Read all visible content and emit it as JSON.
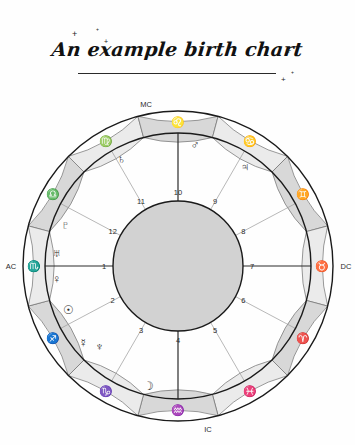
{
  "page": {
    "background_color": "#fefefe",
    "title": "An example birth chart"
  },
  "decorations": {
    "sparkles": [
      {
        "name": "sparkle-top-left",
        "x": 72,
        "y": 30,
        "size": 9
      },
      {
        "name": "sparkle-top-mid",
        "x": 96,
        "y": 27,
        "size": 5
      },
      {
        "name": "sparkle-top-mid2",
        "x": 104,
        "y": 38,
        "size": 7
      },
      {
        "name": "sparkle-right-top",
        "x": 286,
        "y": 47,
        "size": 9
      },
      {
        "name": "sparkle-right-low",
        "x": 281,
        "y": 76,
        "size": 8
      },
      {
        "name": "sparkle-right-dot",
        "x": 291,
        "y": 70,
        "size": 5
      }
    ]
  },
  "chart_data": {
    "type": "birth-chart-wheel",
    "title": "An example birth chart",
    "geometry": {
      "center_x": 178,
      "center_y": 266,
      "outer_radius": 155,
      "ring_inner_radius": 133,
      "inner_disc_radius": 65,
      "ascendant_angle_deg": 180
    },
    "colors": {
      "ring_light": "#ebebeb",
      "ring_dark": "#d8d8d8",
      "inner_disc": "#d2d2d2",
      "stroke": "#1a1a1a",
      "house_line": "#9a9a9a",
      "text": "#2b2b2b"
    },
    "angles": {
      "labels": [
        "AC",
        "DC",
        "MC",
        "IC"
      ],
      "ac_label": "AC",
      "dc_label": "DC",
      "mc_label": "MC",
      "ic_label": "IC"
    },
    "signs": [
      {
        "name": "Libra",
        "glyph": "♎",
        "start_deg": 165,
        "shade": "dark"
      },
      {
        "name": "Virgo",
        "glyph": "♍",
        "start_deg": 135,
        "shade": "light"
      },
      {
        "name": "Leo",
        "glyph": "♌",
        "start_deg": 105,
        "shade": "dark"
      },
      {
        "name": "Cancer",
        "glyph": "♋",
        "start_deg": 75,
        "shade": "light"
      },
      {
        "name": "Gemini",
        "glyph": "♊",
        "start_deg": 45,
        "shade": "dark"
      },
      {
        "name": "Taurus",
        "glyph": "♉",
        "start_deg": 15,
        "shade": "light"
      },
      {
        "name": "Aries",
        "glyph": "♈",
        "start_deg": 345,
        "shade": "dark"
      },
      {
        "name": "Pisces",
        "glyph": "♓",
        "start_deg": 315,
        "shade": "light"
      },
      {
        "name": "Aquarius",
        "glyph": "♒",
        "start_deg": 285,
        "shade": "dark"
      },
      {
        "name": "Capricorn",
        "glyph": "♑",
        "start_deg": 255,
        "shade": "light"
      },
      {
        "name": "Sagittarius",
        "glyph": "♐",
        "start_deg": 225,
        "shade": "dark"
      },
      {
        "name": "Scorpio",
        "glyph": "♏",
        "start_deg": 195,
        "shade": "light"
      }
    ],
    "houses": [
      {
        "number": "1",
        "cusp_deg": 180
      },
      {
        "number": "2",
        "cusp_deg": 208
      },
      {
        "number": "3",
        "cusp_deg": 240
      },
      {
        "number": "4",
        "cusp_deg": 270
      },
      {
        "number": "5",
        "cusp_deg": 300
      },
      {
        "number": "6",
        "cusp_deg": 332
      },
      {
        "number": "7",
        "cusp_deg": 0
      },
      {
        "number": "8",
        "cusp_deg": 28
      },
      {
        "number": "9",
        "cusp_deg": 60
      },
      {
        "number": "10",
        "cusp_deg": 90
      },
      {
        "number": "11",
        "cusp_deg": 120
      },
      {
        "number": "12",
        "cusp_deg": 152
      }
    ],
    "planets": [
      {
        "name": "Pluto",
        "glyph": "♇",
        "angle_deg": 160,
        "radius": 120
      },
      {
        "name": "Venus",
        "glyph": "♀",
        "angle_deg": 186,
        "radius": 122
      },
      {
        "name": "Uranus",
        "glyph": "♅",
        "angle_deg": 174,
        "radius": 122
      },
      {
        "name": "Sun",
        "glyph": "☉",
        "angle_deg": 202,
        "radius": 118
      },
      {
        "name": "Mercury",
        "glyph": "☿",
        "angle_deg": 219,
        "radius": 122
      },
      {
        "name": "Neptune",
        "glyph": "♆",
        "angle_deg": 226,
        "radius": 113
      },
      {
        "name": "Moon",
        "glyph": "☽",
        "angle_deg": 256,
        "radius": 124
      },
      {
        "name": "Jupiter",
        "glyph": "♃",
        "angle_deg": 56,
        "radius": 120
      },
      {
        "name": "Mars",
        "glyph": "♂",
        "angle_deg": 82,
        "radius": 122
      },
      {
        "name": "Saturn",
        "glyph": "♄",
        "angle_deg": 118,
        "radius": 121
      }
    ]
  }
}
